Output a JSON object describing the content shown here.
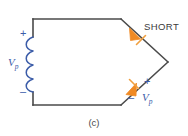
{
  "figure": {
    "caption": "(c)",
    "colors": {
      "wire": "#4a4a4a",
      "inductor": "#3b5ca8",
      "diode": "#f08a24",
      "label_text": "#3a3a3a",
      "polarity_text": "#3b5ca8",
      "background": "#ffffff"
    }
  },
  "labels": {
    "short": "SHORT",
    "source_voltage": "V",
    "source_voltage_sub": "p",
    "source_plus": "+",
    "source_minus": "–",
    "diode_voltage": "V",
    "diode_voltage_sub": "p",
    "diode_plus": "+",
    "diode_minus": "–"
  },
  "components": {
    "inductor": {
      "name": "transformer-primary-winding",
      "turns": 4,
      "orientation": "vertical"
    },
    "diode_top": {
      "name": "shorted-diode",
      "state": "SHORT",
      "orientation": "down-right"
    },
    "diode_bottom": {
      "name": "forward-biased-diode",
      "orientation": "up-right"
    }
  }
}
